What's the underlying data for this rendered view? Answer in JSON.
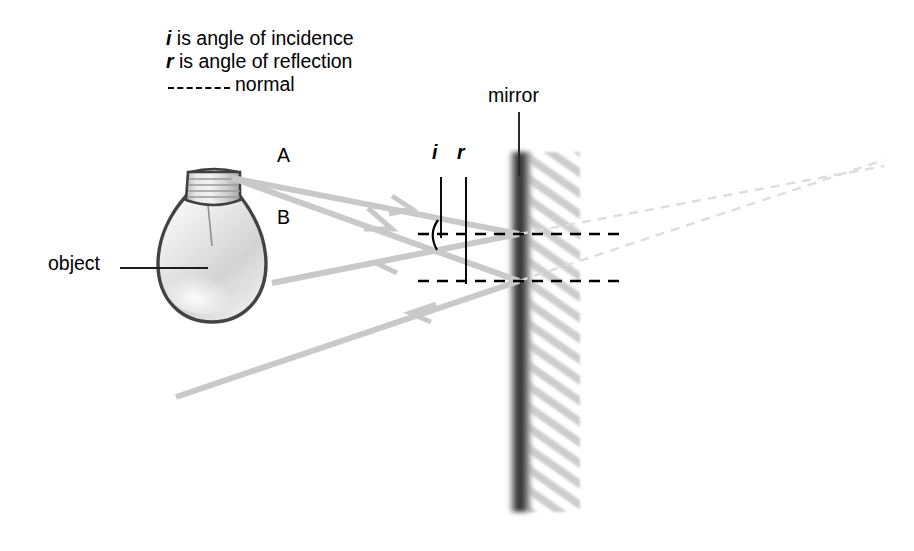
{
  "figure": {
    "background_color": "#ffffff",
    "width": 914,
    "height": 551
  },
  "legend": {
    "incidence": {
      "symbol": "i",
      "text": " is angle of incidence"
    },
    "reflection": {
      "symbol": "r",
      "text": " is angle of reflection"
    },
    "normal_label": "normal",
    "normal_style": "dashed"
  },
  "labels": {
    "mirror": "mirror",
    "object": "object",
    "ray_a": "A",
    "ray_b": "B",
    "angle_i": "i",
    "angle_r": "r"
  },
  "colors": {
    "ray": "#c9c9c9",
    "ray_virtual": "#dcdcdc",
    "normal": "#000000",
    "mirror_face": "#3a3a3a",
    "mirror_hatch": "#c4c4c4",
    "text": "#000000",
    "bulb_outline": "#4a4a4a",
    "bulb_glass": "#e3e3e3",
    "bulb_base": "#cccccc"
  },
  "geometry": {
    "mirror": {
      "x": 519,
      "top": 152,
      "bottom": 512
    },
    "normal_upper_y": 234,
    "normal_lower_y": 281,
    "normal_x_start": 418,
    "normal_x_end": 627,
    "source_point": {
      "x": 232,
      "y": 178
    },
    "bulb_center": {
      "x": 212,
      "y": 265
    }
  }
}
